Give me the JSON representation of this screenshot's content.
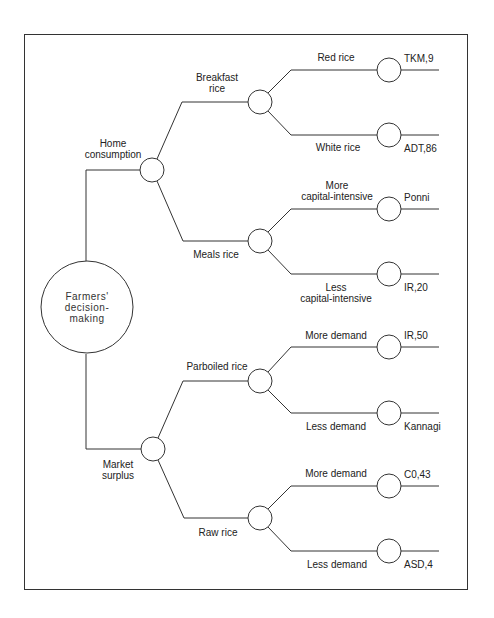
{
  "diagram": {
    "type": "decision-tree",
    "root": {
      "label_lines": [
        "Farmers'",
        "decision-",
        "making"
      ]
    },
    "branches": [
      {
        "id": "home",
        "label_lines": [
          "Home",
          "consumption"
        ],
        "children": [
          {
            "id": "breakfast",
            "label_lines": [
              "Breakfast",
              "rice"
            ],
            "children": [
              {
                "id": "red",
                "edge_label_lines": [
                  "Red rice"
                ],
                "leaf": "TKM,9"
              },
              {
                "id": "white",
                "edge_label_lines": [
                  "White rice"
                ],
                "leaf": "ADT,86"
              }
            ]
          },
          {
            "id": "meals",
            "label_lines": [
              "Meals rice"
            ],
            "children": [
              {
                "id": "more-cap",
                "edge_label_lines": [
                  "More",
                  "capital-intensive"
                ],
                "leaf": "Ponni"
              },
              {
                "id": "less-cap",
                "edge_label_lines": [
                  "Less",
                  "capital-intensive"
                ],
                "leaf": "IR,20"
              }
            ]
          }
        ]
      },
      {
        "id": "market",
        "label_lines": [
          "Market",
          "surplus"
        ],
        "children": [
          {
            "id": "parboiled",
            "label_lines": [
              "Parboiled rice"
            ],
            "children": [
              {
                "id": "parb-more",
                "edge_label_lines": [
                  "More demand"
                ],
                "leaf": "IR,50"
              },
              {
                "id": "parb-less",
                "edge_label_lines": [
                  "Less demand"
                ],
                "leaf": "Kannagi"
              }
            ]
          },
          {
            "id": "raw",
            "label_lines": [
              "Raw rice"
            ],
            "children": [
              {
                "id": "raw-more",
                "edge_label_lines": [
                  "More demand"
                ],
                "leaf": "C0,43"
              },
              {
                "id": "raw-less",
                "edge_label_lines": [
                  "Less demand"
                ],
                "leaf": "ASD,4"
              }
            ]
          }
        ]
      }
    ]
  },
  "colors": {
    "line": "#333333",
    "text": "#222222",
    "background": "#ffffff"
  }
}
